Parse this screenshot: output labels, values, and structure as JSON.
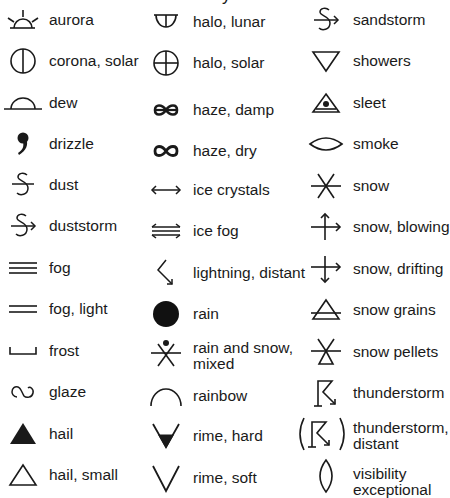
{
  "title_fragment": "y",
  "columns": [
    {
      "items": [
        {
          "label": "aurora",
          "icon": "aurora-icon"
        },
        {
          "label": "corona, solar",
          "icon": "corona-solar-icon"
        },
        {
          "label": "dew",
          "icon": "dew-icon"
        },
        {
          "label": "drizzle",
          "icon": "drizzle-icon"
        },
        {
          "label": "dust",
          "icon": "dust-icon"
        },
        {
          "label": "duststorm",
          "icon": "duststorm-icon"
        },
        {
          "label": "fog",
          "icon": "fog-icon"
        },
        {
          "label": "fog, light",
          "icon": "fog-light-icon"
        },
        {
          "label": "frost",
          "icon": "frost-icon"
        },
        {
          "label": "glaze",
          "icon": "glaze-icon"
        },
        {
          "label": "hail",
          "icon": "hail-icon"
        },
        {
          "label": "hail, small",
          "icon": "hail-small-icon"
        }
      ]
    },
    {
      "items": [
        {
          "label": "halo, lunar",
          "icon": "halo-lunar-icon"
        },
        {
          "label": "halo, solar",
          "icon": "halo-solar-icon"
        },
        {
          "label": "haze, damp",
          "icon": "haze-damp-icon"
        },
        {
          "label": "haze, dry",
          "icon": "haze-dry-icon"
        },
        {
          "label": "ice crystals",
          "icon": "ice-crystals-icon"
        },
        {
          "label": "ice fog",
          "icon": "ice-fog-icon"
        },
        {
          "label": "lightning, distant",
          "icon": "lightning-distant-icon"
        },
        {
          "label": "rain",
          "icon": "rain-icon"
        },
        {
          "label": "rain and snow, mixed",
          "line1": "rain and snow,",
          "line2": "mixed",
          "icon": "rain-and-snow-mixed-icon"
        },
        {
          "label": "rainbow",
          "icon": "rainbow-icon"
        },
        {
          "label": "rime, hard",
          "icon": "rime-hard-icon"
        },
        {
          "label": "rime, soft",
          "icon": "rime-soft-icon"
        }
      ]
    },
    {
      "items": [
        {
          "label": "sandstorm",
          "icon": "sandstorm-icon"
        },
        {
          "label": "showers",
          "icon": "showers-icon"
        },
        {
          "label": "sleet",
          "icon": "sleet-icon"
        },
        {
          "label": "smoke",
          "icon": "smoke-icon"
        },
        {
          "label": "snow",
          "icon": "snow-icon"
        },
        {
          "label": "snow, blowing",
          "icon": "snow-blowing-icon"
        },
        {
          "label": "snow, drifting",
          "icon": "snow-drifting-icon"
        },
        {
          "label": "snow grains",
          "icon": "snow-grains-icon"
        },
        {
          "label": "snow pellets",
          "icon": "snow-pellets-icon"
        },
        {
          "label": "thunderstorm",
          "icon": "thunderstorm-icon"
        },
        {
          "label": "thunderstorm, distant",
          "line1": "thunderstorm,",
          "line2": "distant",
          "icon": "thunderstorm-distant-icon"
        },
        {
          "label": "visibility exceptional",
          "line1": "visibility",
          "line2": "exceptional",
          "icon": "visibility-exceptional-icon"
        }
      ]
    }
  ]
}
